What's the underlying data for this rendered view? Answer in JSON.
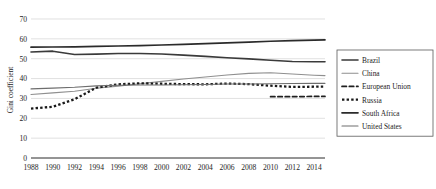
{
  "chart_data": {
    "type": "line",
    "title": "",
    "xlabel": "",
    "ylabel": "Gini coefficient",
    "xlim": [
      1988,
      2015
    ],
    "ylim": [
      0,
      70
    ],
    "yticks": [
      0,
      10,
      20,
      30,
      40,
      50,
      60,
      70
    ],
    "xticks": [
      1988,
      1990,
      1992,
      1994,
      1996,
      1998,
      2000,
      2002,
      2004,
      2006,
      2008,
      2010,
      2012,
      2014
    ],
    "grid": true,
    "legend_position": "right",
    "x": [
      1988,
      1990,
      1992,
      1994,
      1996,
      1998,
      2000,
      2002,
      2004,
      2006,
      2008,
      2010,
      2012,
      2014,
      2015
    ],
    "series": [
      {
        "name": "Brazil",
        "style": "solid",
        "color": "#3a3a3a",
        "width": 1.6,
        "values": [
          53.4,
          53.8,
          52.1,
          52.3,
          52.6,
          52.6,
          52.4,
          51.8,
          51.2,
          50.5,
          49.9,
          49.2,
          48.6,
          48.5,
          48.5
        ]
      },
      {
        "name": "China",
        "style": "solid",
        "color": "#8f8f8f",
        "width": 1.1,
        "values": [
          32.0,
          32.8,
          33.6,
          35.1,
          36.2,
          37.4,
          38.6,
          39.8,
          40.8,
          41.8,
          42.6,
          42.9,
          42.3,
          41.7,
          41.5
        ]
      },
      {
        "name": "European Union",
        "style": "dashed",
        "color": "#1f1f1f",
        "width": 1.7,
        "values": [
          null,
          null,
          null,
          null,
          null,
          null,
          null,
          null,
          null,
          null,
          null,
          30.9,
          30.9,
          31.0,
          31.0
        ]
      },
      {
        "name": "Russia",
        "style": "dotted",
        "color": "#1a1a1a",
        "width": 2.3,
        "values": [
          24.9,
          25.8,
          29.6,
          35.4,
          37.1,
          37.6,
          37.4,
          37.2,
          37.1,
          37.5,
          37.2,
          36.4,
          35.8,
          35.9,
          36.0
        ]
      },
      {
        "name": "South Africa",
        "style": "solid",
        "color": "#2b2b2b",
        "width": 1.7,
        "values": [
          55.8,
          55.9,
          56.0,
          56.2,
          56.4,
          56.6,
          56.9,
          57.2,
          57.6,
          58.0,
          58.4,
          58.8,
          59.1,
          59.4,
          59.5
        ]
      },
      {
        "name": "United States",
        "style": "solid",
        "color": "#6e6e6e",
        "width": 1.1,
        "values": [
          34.8,
          35.2,
          35.6,
          36.3,
          36.6,
          36.8,
          36.8,
          36.9,
          37.0,
          37.3,
          37.3,
          37.4,
          37.5,
          37.6,
          37.6
        ]
      }
    ]
  },
  "legend": {
    "items": [
      {
        "label": "Brazil"
      },
      {
        "label": "China"
      },
      {
        "label": "European Union"
      },
      {
        "label": "Russia"
      },
      {
        "label": "South Africa"
      },
      {
        "label": "United States"
      }
    ]
  }
}
